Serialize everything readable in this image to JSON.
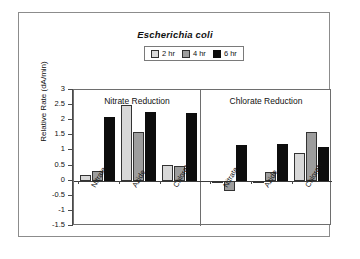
{
  "figure": {
    "title": "Escherichia coli",
    "y_axis_title": "Relative Rate (dA/min)"
  },
  "legend": {
    "items": [
      {
        "label": "2 hr",
        "color": "#d8d8d8"
      },
      {
        "label": "4 hr",
        "color": "#9d9d9d"
      },
      {
        "label": "6 hr",
        "color": "#0d0d0d"
      }
    ]
  },
  "panels": [
    {
      "title": "Nitrate Reduction"
    },
    {
      "title": "Chlorate Reduction"
    }
  ],
  "y_ticks": [
    "3",
    "2.5",
    "2",
    "1.5",
    "1",
    "0.5",
    "0",
    "-0.5",
    "-1",
    "-1.5"
  ],
  "x_labels": [
    "Nitrate",
    "Azide",
    "Chlorate",
    "Nitrate",
    "Azide",
    "Chlorate"
  ],
  "chart_data": {
    "type": "bar",
    "title": "Escherichia coli",
    "xlabel": "",
    "ylabel": "Relative Rate (dA/min)",
    "ylim": [
      -1.5,
      3
    ],
    "ytick_values": [
      3,
      2.5,
      2,
      1.5,
      1,
      0.5,
      0,
      -0.5,
      -1,
      -1.5
    ],
    "grid": false,
    "legend_position": "top-center",
    "panels": [
      {
        "title": "Nitrate Reduction",
        "categories": [
          "Nitrate",
          "Azide",
          "Chlorate"
        ],
        "series": [
          {
            "name": "2 hr",
            "color": "#d8d8d8",
            "values": [
              0.18,
              2.5,
              0.53
            ]
          },
          {
            "name": "4 hr",
            "color": "#9d9d9d",
            "values": [
              0.33,
              1.62,
              0.5
            ]
          },
          {
            "name": "6 hr",
            "color": "#0d0d0d",
            "values": [
              2.1,
              2.28,
              2.23
            ]
          }
        ]
      },
      {
        "title": "Chlorate Reduction",
        "categories": [
          "Nitrate",
          "Azide",
          "Chlorate"
        ],
        "series": [
          {
            "name": "2 hr",
            "color": "#d8d8d8",
            "values": [
              0.0,
              -0.08,
              0.93
            ]
          },
          {
            "name": "4 hr",
            "color": "#9d9d9d",
            "values": [
              -0.35,
              0.3,
              1.62
            ]
          },
          {
            "name": "6 hr",
            "color": "#0d0d0d",
            "values": [
              1.18,
              1.2,
              1.12
            ]
          }
        ]
      }
    ]
  }
}
